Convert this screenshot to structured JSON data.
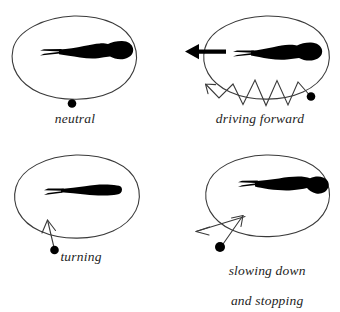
{
  "figure": {
    "title": "",
    "background_color": "#ffffff",
    "ink_color": "#1a1a1a",
    "panels": [
      {
        "id": "neutral",
        "caption": "neutral",
        "organism_icon": "tadpole-silhouette",
        "cue_icon": "dot-marker",
        "arrow_icon": "none",
        "description_text": "neutral"
      },
      {
        "id": "driving-forward",
        "caption": "driving forward",
        "organism_icon": "tadpole-silhouette",
        "cue_icon": "dot-marker",
        "arrow_icon": "solid-left-arrow",
        "trace_icon": "zigzag-trace",
        "pointer_icon": "open-arrowhead",
        "description_text": "driving forward"
      },
      {
        "id": "turning",
        "caption": "turning",
        "organism_icon": "tadpole-silhouette",
        "cue_icon": "dot-marker",
        "arrow_icon": "open-up-arrow",
        "description_text": "turning"
      },
      {
        "id": "slowing-down-and-stopping",
        "caption": "slowing down\nand stopping",
        "caption_line_1": "slowing down",
        "caption_line_2": "and stopping",
        "organism_icon": "tadpole-silhouette",
        "cue_icon": "dot-marker",
        "arrow_icon": "crossed-open-arrows",
        "description_text": "slowing down and stopping"
      }
    ]
  }
}
